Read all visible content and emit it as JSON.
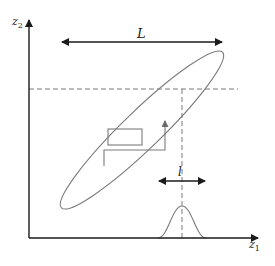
{
  "diagram": {
    "axes": {
      "x_label": "z",
      "x_subscript": "1",
      "y_label": "z",
      "y_subscript": "2"
    },
    "annotations": {
      "large_length_label": "L",
      "small_length_label": "l"
    },
    "colors": {
      "axis": "#1a1a1a",
      "curves": "#7a7a7a",
      "background": "#ffffff"
    },
    "elements": [
      "tilted elongated ellipse",
      "rectangle inside ellipse",
      "step path with upward arrow",
      "horizontal dashed guide line",
      "vertical dashed guide line",
      "gaussian bump on z1 axis",
      "double-headed arrow L",
      "double-headed arrow l"
    ]
  }
}
